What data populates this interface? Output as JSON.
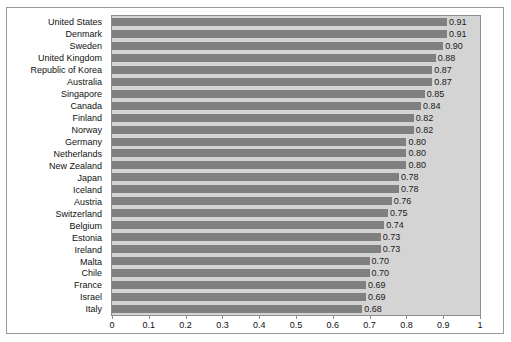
{
  "chart_data": {
    "type": "bar",
    "orientation": "horizontal",
    "title": "",
    "subtitle": "",
    "xlabel": "",
    "ylabel": "",
    "xlim": [
      0,
      1
    ],
    "grid": false,
    "legend": null,
    "xticks": [
      "0",
      "0.1",
      "0.2",
      "0.3",
      "0.4",
      "0.5",
      "0.6",
      "0.7",
      "0.8",
      "0.9",
      "1"
    ],
    "xtick_values": [
      0,
      0.1,
      0.2,
      0.3,
      0.4,
      0.5,
      0.6,
      0.7,
      0.8,
      0.9,
      1
    ],
    "categories": [
      "United States",
      "Denmark",
      "Sweden",
      "United Kingdom",
      "Republic of Korea",
      "Australia",
      "Singapore",
      "Canada",
      "Finland",
      "Norway",
      "Germany",
      "Netherlands",
      "New Zealand",
      "Japan",
      "Iceland",
      "Austria",
      "Switzerland",
      "Belgium",
      "Estonia",
      "Ireland",
      "Malta",
      "Chile",
      "France",
      "Israel",
      "Italy"
    ],
    "values": [
      0.91,
      0.91,
      0.9,
      0.88,
      0.87,
      0.87,
      0.85,
      0.84,
      0.82,
      0.82,
      0.8,
      0.8,
      0.8,
      0.78,
      0.78,
      0.76,
      0.75,
      0.74,
      0.73,
      0.73,
      0.7,
      0.7,
      0.69,
      0.69,
      0.68
    ],
    "data_labels": [
      "0.91",
      "0.91",
      "0.90",
      "0.88",
      "0.87",
      "0.87",
      "0.85",
      "0.84",
      "0.82",
      "0.82",
      "0.80",
      "0.80",
      "0.80",
      "0.78",
      "0.78",
      "0.76",
      "0.75",
      "0.74",
      "0.73",
      "0.73",
      "0.70",
      "0.70",
      "0.69",
      "0.69",
      "0.68"
    ],
    "colors": {
      "bar": "#808080",
      "plot_background": "#d4d4d4",
      "page_background": "#ffffff",
      "border": "#8e8e8e",
      "text": "#111111"
    }
  }
}
